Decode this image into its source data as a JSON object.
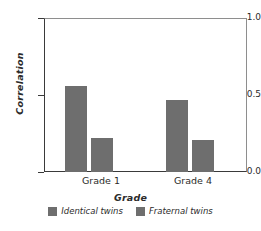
{
  "chart_data": {
    "type": "bar",
    "title": "",
    "xlabel": "Grade",
    "ylabel": "Correlation",
    "categories": [
      "Grade 1",
      "Grade 4"
    ],
    "series": [
      {
        "name": "Identical twins",
        "values": [
          0.56,
          0.47
        ],
        "color": "#6e6e6e"
      },
      {
        "name": "Fraternal twins",
        "values": [
          0.22,
          0.21
        ],
        "color": "#6e6e6e"
      }
    ],
    "ylim": [
      0.0,
      1.0
    ],
    "yticks": [
      "0.0",
      "0.5",
      "1.0"
    ],
    "grid": false,
    "legend_position": "bottom"
  },
  "axes": {
    "y_tick_top": "1.0",
    "y_tick_mid": "0.5",
    "y_tick_bottom": "0.0",
    "y_title": "Correlation",
    "x_tick_0": "Grade 1",
    "x_tick_1": "Grade 4",
    "x_title": "Grade"
  },
  "legend": {
    "entries": [
      {
        "label": "Identical twins"
      },
      {
        "label": "Fraternal twins"
      }
    ]
  },
  "colors": {
    "bar": "#6e6e6e",
    "axis": "#3a3a3a",
    "frame": "#8e8e8e",
    "text": "#2b2b2b",
    "background": "#ffffff"
  }
}
